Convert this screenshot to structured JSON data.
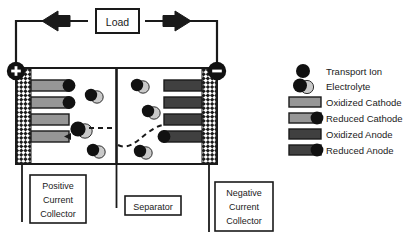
{
  "diagram": {
    "circuit": {
      "load_label": "Load",
      "electron_arrow_label": "e-",
      "current_arrow_label": "i",
      "electron_arrow_direction": "left",
      "current_arrow_direction": "right"
    },
    "terminals": {
      "positive_symbol": "+",
      "negative_symbol": "−"
    },
    "callouts": [
      {
        "id": "positive-current-collector",
        "lines": [
          "Positive",
          "Current",
          "Collector"
        ]
      },
      {
        "id": "separator",
        "lines": [
          "Separator"
        ]
      },
      {
        "id": "negative-current-collector",
        "lines": [
          "Negative",
          "Current",
          "Collector"
        ]
      }
    ],
    "legend": {
      "items": [
        {
          "key": "transport-ion",
          "label": "Transport Ion",
          "glyph": "dark-circle"
        },
        {
          "key": "electrolyte",
          "label": "Electrolyte",
          "glyph": "dark-circle-with-light-circle"
        },
        {
          "key": "oxidized-cathode",
          "label": "Oxidized Cathode",
          "glyph": "light-gray-bar"
        },
        {
          "key": "reduced-cathode",
          "label": "Reduced Cathode",
          "glyph": "light-gray-bar-with-dark-circle"
        },
        {
          "key": "oxidized-anode",
          "label": "Oxidized Anode",
          "glyph": "dark-gray-bar"
        },
        {
          "key": "reduced-anode",
          "label": "Reduced Anode",
          "glyph": "dark-gray-bar-with-dark-circle"
        }
      ]
    },
    "cathode_bars": [
      {
        "index": 0,
        "state": "reduced"
      },
      {
        "index": 1,
        "state": "reduced"
      },
      {
        "index": 2,
        "state": "oxidized"
      },
      {
        "index": 3,
        "state": "oxidized"
      }
    ],
    "anode_bars": [
      {
        "index": 0,
        "state": "oxidized"
      },
      {
        "index": 1,
        "state": "oxidized"
      },
      {
        "index": 2,
        "state": "oxidized"
      },
      {
        "index": 3,
        "state": "reduced"
      }
    ],
    "colors": {
      "outline": "#000000",
      "cathode_fill": "#969696",
      "anode_fill": "#404040",
      "ion_fill": "#111111",
      "electrolyte_fill": "#c9c9c9",
      "background": "#ffffff"
    }
  }
}
